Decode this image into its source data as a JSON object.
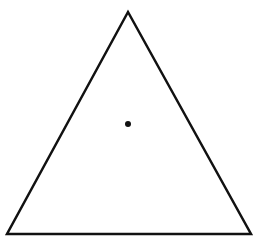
{
  "diagram": {
    "shape": "equilateral-triangle",
    "vertices": {
      "apex": [
        128,
        12
      ],
      "bottom_left": [
        7,
        234
      ],
      "bottom_right": [
        251,
        234
      ]
    },
    "center_point": [
      128,
      124
    ],
    "colors": {
      "stroke": "#111111",
      "fill": "#ffffff",
      "dot": "#111111",
      "background": "#ffffff"
    }
  }
}
